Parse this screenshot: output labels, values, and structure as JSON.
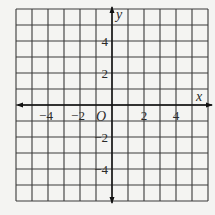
{
  "figure": {
    "type": "coordinate-grid",
    "grid": {
      "cells_x": 12,
      "cells_y": 12,
      "x_range": [
        -6,
        6
      ],
      "y_range": [
        -6,
        6
      ],
      "unit": 1
    },
    "axes": {
      "x_label": "x",
      "y_label": "y",
      "origin_label": "O",
      "arrows": "both-ends"
    },
    "x_ticks": [
      {
        "value": -4,
        "label": "−4"
      },
      {
        "value": -2,
        "label": "−2"
      },
      {
        "value": 2,
        "label": "2"
      },
      {
        "value": 4,
        "label": "4"
      }
    ],
    "y_ticks": [
      {
        "value": 4,
        "label": "4"
      },
      {
        "value": 2,
        "label": "2"
      },
      {
        "value": -2,
        "label": "−2"
      },
      {
        "value": -4,
        "label": "−4"
      }
    ],
    "colors": {
      "background": "#f4f4f2",
      "grid": "#3a3a3a",
      "axis": "#111111",
      "text": "#2a2a2a"
    }
  }
}
